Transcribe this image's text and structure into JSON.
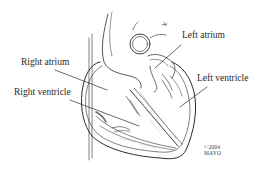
{
  "diagram": {
    "labels": [
      {
        "id": "left-atrium",
        "text": "Left atrium"
      },
      {
        "id": "right-atrium",
        "text": "Right atrium"
      },
      {
        "id": "left-ventricle",
        "text": "Left ventricle"
      },
      {
        "id": "right-ventricle",
        "text": "Right ventricle"
      }
    ],
    "copyright": {
      "line1": "©2004",
      "line2": "MAYO"
    },
    "colors": {
      "line": "#2b2b2b",
      "shade": "#8a8a8a",
      "background": "#ffffff"
    }
  }
}
